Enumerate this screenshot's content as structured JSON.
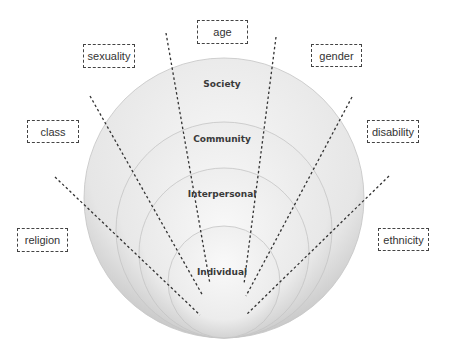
{
  "diagram": {
    "levels": [
      {
        "label": "Society",
        "cx": 224,
        "cy": 198,
        "r": 140,
        "fill_outer": "#d4d4d4",
        "fill_inner": "#f4f4f4",
        "label_x": 222,
        "label_y": 85
      },
      {
        "label": "Community",
        "cx": 224,
        "cy": 230,
        "r": 108,
        "fill_outer": "#d8d8d8",
        "fill_inner": "#f5f5f5",
        "label_x": 222,
        "label_y": 140
      },
      {
        "label": "Interpersonal",
        "cx": 224,
        "cy": 253,
        "r": 85,
        "fill_outer": "#dadada",
        "fill_inner": "#f6f6f6",
        "label_x": 222,
        "label_y": 195
      },
      {
        "label": "Individual",
        "cx": 224,
        "cy": 282,
        "r": 56,
        "fill_outer": "#dcdcdc",
        "fill_inner": "#f8f8f8",
        "label_x": 222,
        "label_y": 273
      }
    ],
    "categories": [
      {
        "label": "age",
        "x": 197,
        "y": 20,
        "w": 51,
        "h": 24
      },
      {
        "label": "sexuality",
        "x": 83,
        "y": 44,
        "w": 52,
        "h": 24
      },
      {
        "label": "gender",
        "x": 311,
        "y": 44,
        "w": 51,
        "h": 23
      },
      {
        "label": "class",
        "x": 27,
        "y": 120,
        "w": 52,
        "h": 23
      },
      {
        "label": "disability",
        "x": 367,
        "y": 120,
        "w": 52,
        "h": 23
      },
      {
        "label": "religion",
        "x": 17,
        "y": 228,
        "w": 51,
        "h": 24
      },
      {
        "label": "ethnicity",
        "x": 378,
        "y": 228,
        "w": 51,
        "h": 23
      }
    ],
    "dashed_lines": [
      {
        "name": "age-line",
        "x1": 166,
        "y1": 33,
        "x2": 210,
        "y2": 284
      },
      {
        "name": "gender-vertical-line",
        "x1": 276,
        "y1": 37,
        "x2": 244,
        "y2": 284
      },
      {
        "name": "sexuality-line",
        "x1": 90,
        "y1": 96,
        "x2": 203,
        "y2": 296
      },
      {
        "name": "gender-line",
        "x1": 352,
        "y1": 97,
        "x2": 246,
        "y2": 296
      },
      {
        "name": "class-line",
        "x1": 55,
        "y1": 177,
        "x2": 200,
        "y2": 315
      },
      {
        "name": "disability-line",
        "x1": 389,
        "y1": 176,
        "x2": 246,
        "y2": 315
      }
    ],
    "line_color": "#333333"
  }
}
